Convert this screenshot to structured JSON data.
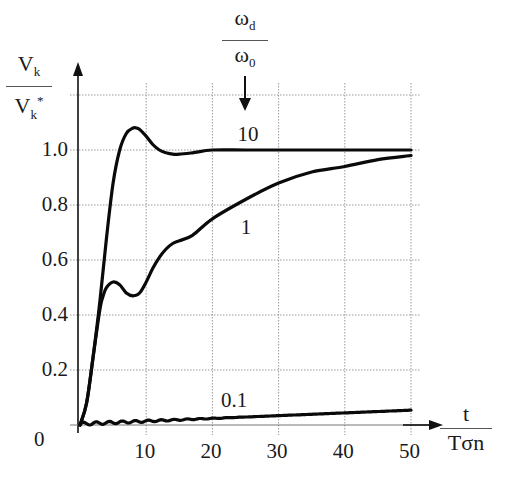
{
  "chart_data": {
    "type": "line",
    "title": "",
    "xlabel": "t / Tσn",
    "ylabel": "Vk / Vk*",
    "xlim": [
      0,
      50
    ],
    "ylim": [
      0,
      1.2
    ],
    "grid": true,
    "x_ticks": [
      0,
      10,
      20,
      30,
      40,
      50
    ],
    "x_tick_labels": [
      "10",
      "20",
      "30",
      "40",
      "50"
    ],
    "y_ticks": [
      0.0,
      0.2,
      0.4,
      0.6,
      0.8,
      1.0
    ],
    "y_tick_labels": [
      "0",
      "0.2",
      "0.4",
      "0.6",
      "0.8",
      "1.0"
    ],
    "legend_title": "ωd / ω0",
    "series": [
      {
        "name": "10",
        "x": [
          0,
          1,
          2,
          3,
          4,
          5,
          6,
          7,
          8,
          8.5,
          9,
          10,
          11,
          12,
          13,
          14,
          15,
          17,
          20,
          25,
          30,
          40,
          50
        ],
        "values": [
          0,
          0.08,
          0.25,
          0.45,
          0.68,
          0.88,
          1.0,
          1.06,
          1.08,
          1.08,
          1.075,
          1.05,
          1.02,
          1.0,
          0.99,
          0.985,
          0.985,
          0.99,
          1.0,
          1.0,
          1.0,
          1.0,
          1.0
        ]
      },
      {
        "name": "1",
        "x": [
          0,
          1,
          2,
          3,
          3.5,
          4,
          5,
          6,
          7,
          8,
          9,
          10,
          11,
          12,
          13,
          14,
          15,
          17,
          20,
          25,
          30,
          35,
          40,
          45,
          50
        ],
        "values": [
          0,
          0.08,
          0.25,
          0.42,
          0.47,
          0.5,
          0.52,
          0.51,
          0.48,
          0.47,
          0.48,
          0.52,
          0.57,
          0.61,
          0.64,
          0.66,
          0.67,
          0.69,
          0.75,
          0.82,
          0.88,
          0.92,
          0.94,
          0.965,
          0.98
        ]
      },
      {
        "name": "0.1",
        "x": [
          0,
          5,
          10,
          20,
          30,
          40,
          50
        ],
        "values": [
          0,
          0.005,
          0.01,
          0.022,
          0.032,
          0.042,
          0.05
        ]
      }
    ],
    "annotations": [
      {
        "text": "10",
        "x": 25,
        "y": 1.06
      },
      {
        "text": "1",
        "x": 25.5,
        "y": 0.72
      },
      {
        "text": "0.1",
        "x": 22.5,
        "y": 0.09
      }
    ]
  },
  "labels": {
    "y_num": "V",
    "y_num_sub": "k",
    "y_den": "V",
    "y_den_sub": "k",
    "y_den_sup": "*",
    "x_num": "t",
    "x_den": "Tσn",
    "legend_num": "ω",
    "legend_num_sub": "d",
    "legend_den": "ω",
    "legend_den_sub": "0"
  }
}
